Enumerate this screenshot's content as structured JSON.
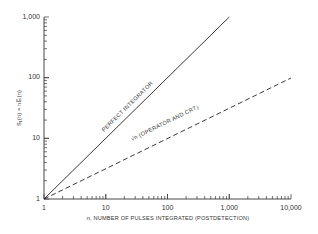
{
  "chart_data": {
    "type": "line",
    "title": "",
    "xlabel": "n, NUMBER OF PULSES INTEGRATED (POSTDETECTION)",
    "ylabel": "S_1(n) = nE_i(n)",
    "xscale": "log",
    "yscale": "log",
    "xlim": [
      1,
      10000
    ],
    "ylim": [
      1,
      1000
    ],
    "x_ticks": [
      "1",
      "10",
      "100",
      "1,000",
      "10,000"
    ],
    "y_ticks": [
      "1",
      "10",
      "100",
      "1,000"
    ],
    "grid": false,
    "legend": "none (inline line labels)",
    "series": [
      {
        "name": "PERFECT INTEGRATOR",
        "style": "solid",
        "x": [
          1,
          10,
          100,
          1000
        ],
        "values": [
          1,
          10,
          100,
          1000
        ]
      },
      {
        "name": "√n (OPERATOR AND CRT)",
        "style": "dashed",
        "x": [
          1,
          10,
          100,
          1000,
          10000
        ],
        "values": [
          1,
          3.16,
          10,
          31.6,
          100
        ]
      }
    ]
  },
  "labels": {
    "x_axis_title": "n, NUMBER OF PULSES INTEGRATED (POSTDETECTION)",
    "y_axis_title": "S₁(n) = nE̅ᵢ(n)",
    "solid_line": "PERFECT INTEGRATOR",
    "dashed_line": "√n (OPERATOR AND CRT)",
    "x_ticks": [
      "1",
      "10",
      "100",
      "1,000",
      "10,000"
    ],
    "y_ticks": [
      "1",
      "10",
      "100",
      "1,000"
    ]
  }
}
